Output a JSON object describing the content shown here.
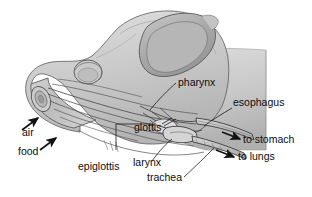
{
  "figure": {
    "background_color": "#ffffff",
    "outline_color": "#3c3c3c",
    "fill_light": "#d8d8d8",
    "fill_mid": "#c0c0c0",
    "fill_dark": "#a3a3a3",
    "label_color": "#0d0d0d"
  },
  "labels": {
    "air": "air",
    "food": "food",
    "epiglottis": "epiglottis",
    "glottis": "glottis",
    "larynx": "larynx",
    "trachea": "trachea",
    "pharynx": "pharynx",
    "esophagus": "esophagus",
    "to_stomach": "to stomach",
    "to_lungs": "to lungs"
  },
  "anatomy_parts": [
    {
      "name": "air",
      "label": "air",
      "kind": "inflow-arrow",
      "x": 22,
      "y": 136
    },
    {
      "name": "food",
      "label": "food",
      "kind": "inflow-arrow",
      "x": 18,
      "y": 155
    },
    {
      "name": "epiglottis",
      "label": "epiglottis",
      "kind": "leader-label",
      "x": 78,
      "y": 170
    },
    {
      "name": "glottis",
      "label": "glottis",
      "kind": "leader-label",
      "x": 134,
      "y": 131
    },
    {
      "name": "larynx",
      "label": "larynx",
      "kind": "leader-label",
      "x": 133,
      "y": 166
    },
    {
      "name": "trachea",
      "label": "trachea",
      "kind": "leader-label",
      "x": 147,
      "y": 181
    },
    {
      "name": "pharynx",
      "label": "pharynx",
      "kind": "leader-label",
      "x": 178,
      "y": 86
    },
    {
      "name": "esophagus",
      "label": "esophagus",
      "kind": "leader-label",
      "x": 233,
      "y": 106
    },
    {
      "name": "to-stomach",
      "label": "to stomach",
      "kind": "outflow-arrow",
      "x": 243,
      "y": 143
    },
    {
      "name": "to-lungs",
      "label": "to lungs",
      "kind": "outflow-arrow",
      "x": 238,
      "y": 160
    }
  ]
}
